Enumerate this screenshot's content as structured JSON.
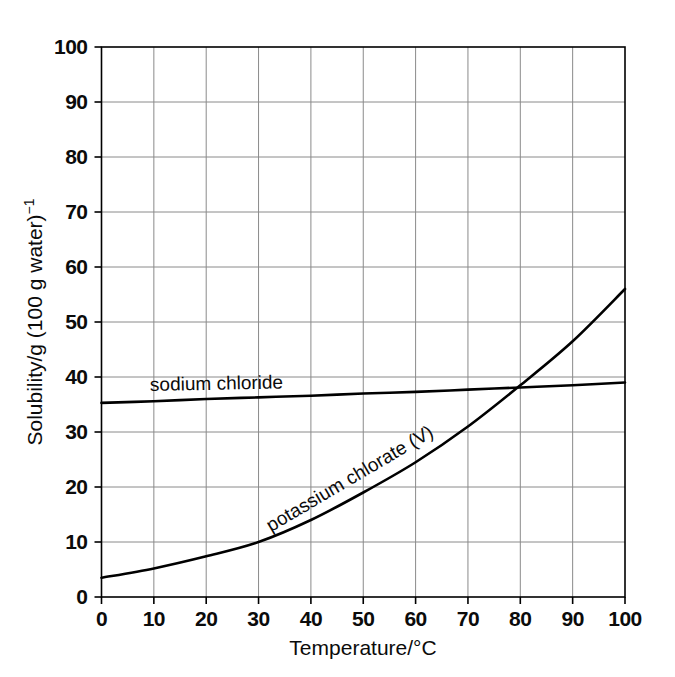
{
  "chart_data": {
    "type": "line",
    "title": "",
    "xlabel": "Temperature/°C",
    "ylabel": "Solubility/g (100 g water)⁻¹",
    "ylabel_main": "Solubility/g (100 g water)",
    "ylabel_exponent": "−1",
    "xlim": [
      0,
      100
    ],
    "ylim": [
      0,
      100
    ],
    "xticks": [
      0,
      10,
      20,
      30,
      40,
      50,
      60,
      70,
      80,
      90,
      100
    ],
    "yticks": [
      0,
      10,
      20,
      30,
      40,
      50,
      60,
      70,
      80,
      90,
      100
    ],
    "xtick_labels": [
      "0",
      "10",
      "20",
      "30",
      "40",
      "50",
      "60",
      "70",
      "80",
      "90",
      "100"
    ],
    "ytick_labels": [
      "0",
      "10",
      "20",
      "30",
      "40",
      "50",
      "60",
      "70",
      "80",
      "90",
      "100"
    ],
    "grid": true,
    "grid_color": "#8a8a8a",
    "axis_color": "#000000",
    "legend": "inline-labels",
    "series": [
      {
        "name": "sodium chloride",
        "label": "sodium chloride",
        "color": "#000000",
        "x": [
          0,
          10,
          20,
          30,
          40,
          50,
          60,
          70,
          80,
          90,
          100
        ],
        "values": [
          35.3,
          35.6,
          36.0,
          36.3,
          36.6,
          37.0,
          37.3,
          37.7,
          38.1,
          38.5,
          39.0
        ]
      },
      {
        "name": "potassium chlorate (V)",
        "label": "potassium chlorate (V)",
        "color": "#000000",
        "x": [
          0,
          10,
          20,
          30,
          40,
          50,
          60,
          70,
          80,
          90,
          100
        ],
        "values": [
          3.5,
          5.2,
          7.4,
          10.0,
          14.0,
          19.0,
          24.5,
          31.0,
          38.5,
          46.5,
          56.0
        ]
      }
    ],
    "annotations": [
      {
        "text": "sodium chloride",
        "x": 9.5,
        "y": 40.5,
        "rotation": -1.1
      },
      {
        "text": "potassium chlorate (V)",
        "x": 32,
        "y": 14.8,
        "rotation": -30.5
      }
    ]
  }
}
